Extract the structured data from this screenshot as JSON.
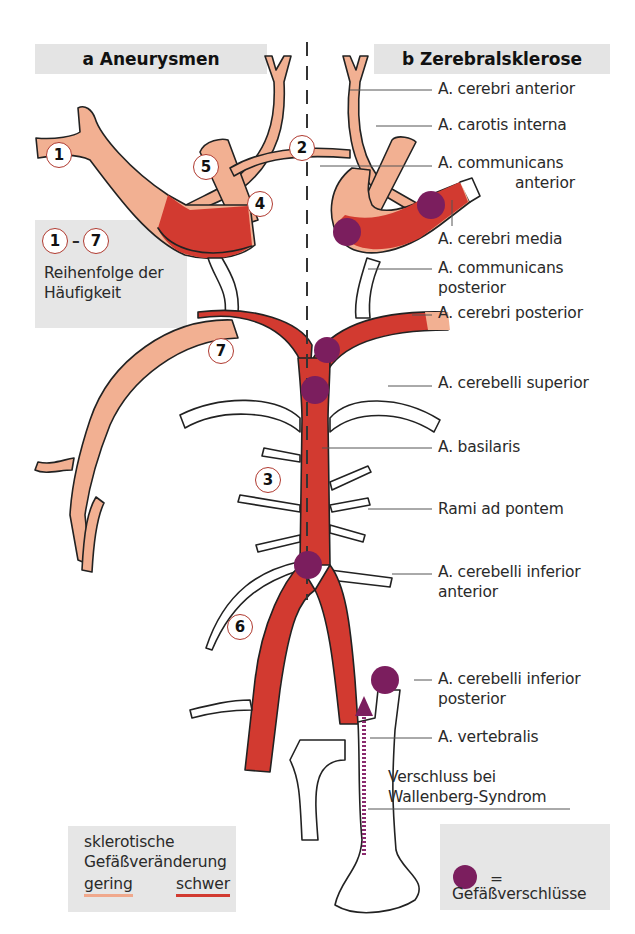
{
  "panels": {
    "a": {
      "title": "a  Aneurysmen"
    },
    "b": {
      "title": "b  Zerebralsklerose"
    }
  },
  "aneurysm_numbers": [
    "1",
    "2",
    "3",
    "4",
    "5",
    "6",
    "7"
  ],
  "frequency_legend": {
    "range_start": "1",
    "range_dash": "–",
    "range_end": "7",
    "line1": "Reihenfolge der",
    "line2": "Häufigkeit"
  },
  "labels": {
    "cerebri_anterior": "A. cerebri anterior",
    "carotis_interna": "A. carotis interna",
    "communicans_anterior_1": "A. communicans",
    "communicans_anterior_2": "anterior",
    "cerebri_media": "A. cerebri media",
    "communicans_posterior_1": "A. communicans",
    "communicans_posterior_2": "posterior",
    "cerebri_posterior": "A. cerebri posterior",
    "cerebelli_superior": "A. cerebelli superior",
    "basilaris": "A. basilaris",
    "rami_ad_pontem": "Rami ad pontem",
    "cerebelli_inferior_anterior_1": "A. cerebelli inferior",
    "cerebelli_inferior_anterior_2": "anterior",
    "cerebelli_inferior_posterior_1": "A. cerebelli inferior",
    "cerebelli_inferior_posterior_2": "posterior",
    "vertebralis": "A. vertebralis",
    "wallenberg_1": "Verschluss bei",
    "wallenberg_2": "Wallenberg-Syndrom"
  },
  "sclerosis_legend": {
    "line1": "sklerotische",
    "line2": "Gefäßveränderung",
    "mild": "gering",
    "severe": "schwer"
  },
  "occlusion_legend": {
    "equals": "=",
    "text": "Gefäßverschlüsse"
  },
  "colors": {
    "mild_vessel": "#f2b092",
    "severe_vessel": "#d23a30",
    "occlusion": "#7b1e5e",
    "outline": "#222222",
    "panel_bg": "#e4e4e4"
  }
}
